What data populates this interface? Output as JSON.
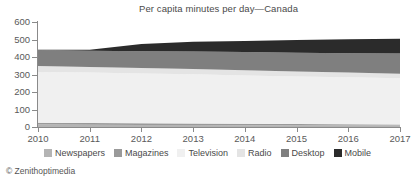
{
  "chart_data": {
    "type": "area",
    "stacked": true,
    "title": "Per capita minutes per day—Canada",
    "xlabel": "",
    "ylabel": "",
    "categories": [
      2010,
      2011,
      2012,
      2013,
      2014,
      2015,
      2016,
      2017
    ],
    "xtick_labels": [
      "2010",
      "2011",
      "2012",
      "2013",
      "2014",
      "2015",
      "2016",
      "2017"
    ],
    "ytick_labels": [
      "0",
      "100",
      "200",
      "300",
      "400",
      "500",
      "600"
    ],
    "ytick_values": [
      0,
      100,
      200,
      300,
      400,
      500,
      600
    ],
    "ylim": [
      0,
      600
    ],
    "xlim": [
      2010,
      2017
    ],
    "grid": false,
    "legend_position": "bottom",
    "series": [
      {
        "name": "Newspapers",
        "color": "#b4b4b4",
        "values": [
          14,
          13,
          12,
          11,
          10,
          9,
          9,
          8
        ]
      },
      {
        "name": "Magazines",
        "color": "#9a9a9a",
        "values": [
          11,
          10,
          9,
          9,
          8,
          8,
          7,
          7
        ]
      },
      {
        "name": "Television",
        "color": "#f0f0f0",
        "values": [
          290,
          288,
          285,
          281,
          277,
          272,
          268,
          263
        ]
      },
      {
        "name": "Radio",
        "color": "#e4e4e4",
        "values": [
          33,
          32,
          31,
          30,
          29,
          28,
          27,
          27
        ]
      },
      {
        "name": "Desktop",
        "color": "#7f7f7f",
        "values": [
          92,
          93,
          96,
          100,
          104,
          108,
          111,
          115
        ]
      },
      {
        "name": "Mobile",
        "color": "#2b2b2b",
        "values": [
          2,
          6,
          41,
          56,
          64,
          72,
          79,
          85
        ]
      }
    ],
    "totals": [
      442,
      442,
      474,
      487,
      492,
      497,
      501,
      505
    ],
    "source": "© Zenithoptimedia"
  },
  "legend": {
    "items": [
      {
        "label": "Newspapers",
        "color": "#b4b4b4"
      },
      {
        "label": "Magazines",
        "color": "#9a9a9a"
      },
      {
        "label": "Television",
        "color": "#f0f0f0"
      },
      {
        "label": "Radio",
        "color": "#e4e4e4"
      },
      {
        "label": "Desktop",
        "color": "#7f7f7f"
      },
      {
        "label": "Mobile",
        "color": "#2b2b2b"
      }
    ]
  },
  "axis": {
    "y_ticks": [
      "600",
      "500",
      "400",
      "300",
      "200",
      "100",
      "0"
    ],
    "x_ticks": [
      "2010",
      "2011",
      "2012",
      "2013",
      "2014",
      "2015",
      "2016",
      "2017"
    ]
  },
  "colors": {
    "axis": "#8a8a8a",
    "text": "#4a4a4a",
    "background": "#ffffff"
  }
}
